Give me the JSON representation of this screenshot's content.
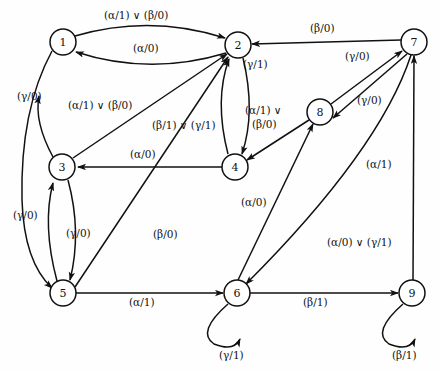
{
  "diagram": {
    "stroke_color": "#111111",
    "node_fill": "#ffffff",
    "background": "#fefefe"
  },
  "nodes": [
    {
      "id": "1",
      "label": "1",
      "cx": 63,
      "cy": 42,
      "r": 13
    },
    {
      "id": "2",
      "label": "2",
      "cx": 238,
      "cy": 45,
      "r": 13
    },
    {
      "id": "3",
      "label": "3",
      "cx": 62,
      "cy": 167,
      "r": 13
    },
    {
      "id": "4",
      "label": "4",
      "cx": 235,
      "cy": 167,
      "r": 13
    },
    {
      "id": "5",
      "label": "5",
      "cx": 63,
      "cy": 293,
      "r": 13
    },
    {
      "id": "6",
      "label": "6",
      "cx": 237,
      "cy": 293,
      "r": 13
    },
    {
      "id": "7",
      "label": "7",
      "cx": 414,
      "cy": 42,
      "r": 13
    },
    {
      "id": "8",
      "label": "8",
      "cx": 320,
      "cy": 112,
      "r": 13
    },
    {
      "id": "9",
      "label": "9",
      "cx": 412,
      "cy": 293,
      "r": 13
    }
  ],
  "edges": [
    {
      "from": "1",
      "to": "2",
      "label": "(α/1) ∨ (β/0)",
      "lx": 104,
      "ly": 9
    },
    {
      "from": "2",
      "to": "1",
      "label": "(α/0)",
      "lx": 133,
      "ly": 42
    },
    {
      "from": "1",
      "to": "5",
      "label": "(γ/0)",
      "lx": 17,
      "ly": 90
    },
    {
      "from": "3",
      "to": "1",
      "label": "(γ/0)",
      "lx": 13,
      "ly": 215
    },
    {
      "from": "3",
      "to": "2",
      "label": "(α/1) ∨ (β/0)",
      "lx": 68,
      "ly": 99
    },
    {
      "from": "4",
      "to": "2",
      "label": "(β/1) ∨ (γ/1)",
      "lx": 152,
      "ly": 119
    },
    {
      "from": "2",
      "to": "4",
      "label": "(β/1) ∨ (γ/1)",
      "lx": 243,
      "ly": 83
    },
    {
      "from": "4",
      "to": "3",
      "label": "(α/0)",
      "lx": 130,
      "ly": 150
    },
    {
      "from": "3",
      "to": "5",
      "label": "(γ/0)",
      "lx": 66,
      "ly": 227
    },
    {
      "from": "5",
      "to": "2",
      "label": "(β/0)",
      "lx": 153,
      "ly": 230
    },
    {
      "from": "5",
      "to": "6",
      "label": "(α/1)",
      "lx": 129,
      "ly": 297
    },
    {
      "from": "6",
      "to": "6",
      "label": "(γ/1)",
      "lx": 220,
      "ly": 350
    },
    {
      "from": "6",
      "to": "9",
      "label": "(β/1)",
      "lx": 305,
      "ly": 297
    },
    {
      "from": "9",
      "to": "9",
      "label": "(β/1)",
      "lx": 394,
      "ly": 350
    },
    {
      "from": "9",
      "to": "7",
      "label": "(α/0) ∨ (γ/1)",
      "lx": 327,
      "ly": 240
    },
    {
      "from": "7",
      "to": "2",
      "label": "(β/0)",
      "lx": 313,
      "ly": 24
    },
    {
      "from": "8",
      "to": "7",
      "label": "(γ/0)",
      "lx": 348,
      "ly": 53
    },
    {
      "from": "7",
      "to": "8",
      "label": "(γ/0)",
      "lx": 360,
      "ly": 96
    },
    {
      "from": "8",
      "to": "4",
      "label": "(α/1) ∨\n(β/0)",
      "lx": 250,
      "ly": 108
    },
    {
      "from": "6",
      "to": "8",
      "label": "(α/0)",
      "lx": 242,
      "ly": 200
    },
    {
      "from": "7",
      "to": "6",
      "label": "(α/1)",
      "lx": 368,
      "ly": 163
    }
  ],
  "edge_labels": {
    "l1": "(α/1) ∨ (β/0)",
    "l2": "(α/0)",
    "l3": "(γ/0)",
    "l4": "(α/1) ∨ (β/0)",
    "l5": "(β/1) ∨ (γ/1)",
    "l6": "(α/1) ∨",
    "l6b": "(β/0)",
    "l7": "(γ/1)",
    "l8": "(α/0)",
    "l9": "(γ/0)",
    "l10": "(γ/0)",
    "l11": "(β/0)",
    "l12": "(α/1)",
    "l13": "(γ/1)",
    "l14": "(β/1)",
    "l15": "(β/1)",
    "l16": "(α/0) ∨ (γ/1)",
    "l17": "(β/0)",
    "l18": "(γ/0)",
    "l19": "(γ/0)",
    "l20": "(α/0)",
    "l21": "(α/1)"
  },
  "node_labels": {
    "n1": "1",
    "n2": "2",
    "n3": "3",
    "n4": "4",
    "n5": "5",
    "n6": "6",
    "n7": "7",
    "n8": "8",
    "n9": "9"
  }
}
